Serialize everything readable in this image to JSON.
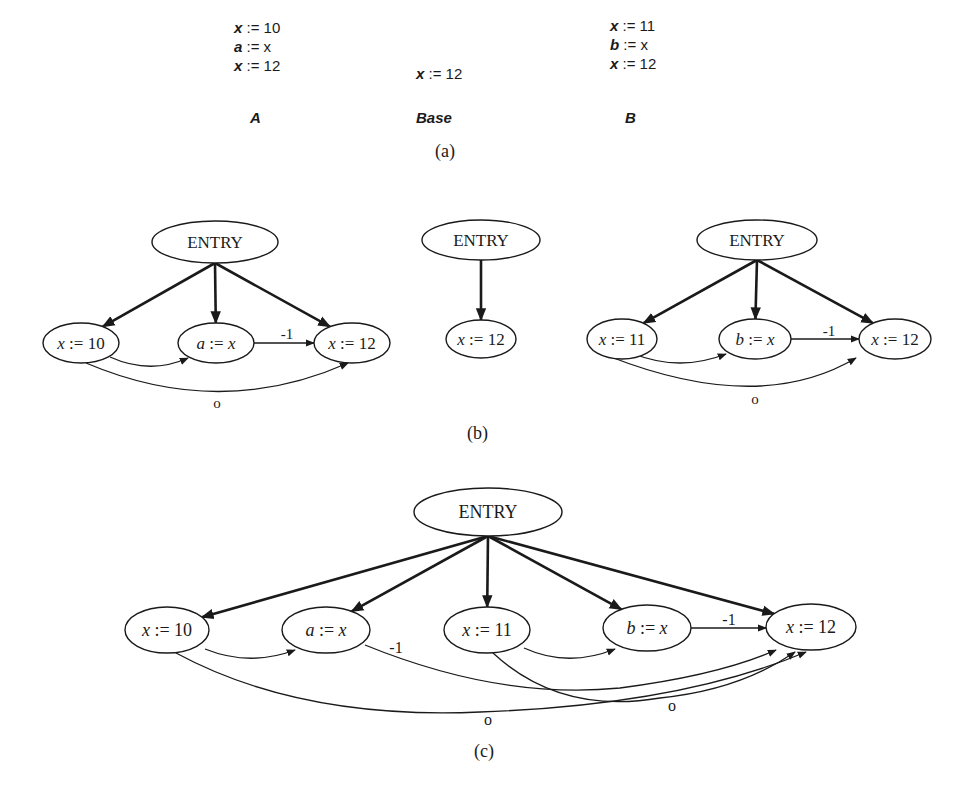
{
  "part_a": {
    "caption": "(a)",
    "programs": [
      {
        "name": "A",
        "lines": [
          {
            "var": "x",
            "rhs": ":= 10"
          },
          {
            "var": "a",
            "rhs": ":= x"
          },
          {
            "var": "x",
            "rhs": ":= 12"
          }
        ]
      },
      {
        "name": "Base",
        "lines": [
          {
            "var": "x",
            "rhs": ":= 12"
          }
        ]
      },
      {
        "name": "B",
        "lines": [
          {
            "var": "x",
            "rhs": ":= 11"
          },
          {
            "var": "b",
            "rhs": ":= x"
          },
          {
            "var": "x",
            "rhs": ":= 12"
          }
        ]
      }
    ]
  },
  "part_b": {
    "caption": "(b)",
    "graphs": [
      {
        "name": "A",
        "nodes": [
          {
            "id": "e",
            "label": "ENTRY",
            "cx": 215,
            "cy": 242,
            "rx": 63,
            "ry": 21
          },
          {
            "id": "n1",
            "label": "x := 10",
            "cx": 81,
            "cy": 343,
            "rx": 38,
            "ry": 20
          },
          {
            "id": "n2",
            "label": "a := x",
            "cx": 216,
            "cy": 343,
            "rx": 38,
            "ry": 20
          },
          {
            "id": "n3",
            "label": "x := 12",
            "cx": 352,
            "cy": 343,
            "rx": 38,
            "ry": 20
          }
        ],
        "control_edges": [
          [
            "e",
            "n1"
          ],
          [
            "e",
            "n2"
          ],
          [
            "e",
            "n3"
          ]
        ],
        "flow_edges": [
          {
            "from": "n1",
            "to": "n2",
            "path": "M110,357 Q150,375 188,358",
            "label": ""
          },
          {
            "from": "n2",
            "to": "n3",
            "path": "M254,343 L314,343",
            "label": "-1",
            "lx": 287,
            "ly": 339
          },
          {
            "from": "n1",
            "to": "n3",
            "path": "M86,363 Q220,420 348,363",
            "label": "o",
            "lx": 217,
            "ly": 408
          }
        ]
      },
      {
        "name": "Base",
        "nodes": [
          {
            "id": "e",
            "label": "ENTRY",
            "cx": 481,
            "cy": 240,
            "rx": 59,
            "ry": 20
          },
          {
            "id": "n1",
            "label": "x := 12",
            "cx": 481,
            "cy": 339,
            "rx": 35,
            "ry": 19
          }
        ],
        "control_edges": [
          [
            "e",
            "n1"
          ]
        ],
        "flow_edges": []
      },
      {
        "name": "B",
        "nodes": [
          {
            "id": "e",
            "label": "ENTRY",
            "cx": 757,
            "cy": 240,
            "rx": 60,
            "ry": 20
          },
          {
            "id": "n1",
            "label": "x := 11",
            "cx": 622,
            "cy": 339,
            "rx": 35,
            "ry": 20
          },
          {
            "id": "n2",
            "label": "b := x",
            "cx": 755,
            "cy": 339,
            "rx": 36,
            "ry": 20
          },
          {
            "id": "n3",
            "label": "x := 12",
            "cx": 895,
            "cy": 339,
            "rx": 36,
            "ry": 20
          }
        ],
        "control_edges": [
          [
            "e",
            "n1"
          ],
          [
            "e",
            "n2"
          ],
          [
            "e",
            "n3"
          ]
        ],
        "flow_edges": [
          {
            "from": "n1",
            "to": "n2",
            "path": "M634,354 Q680,372 726,354",
            "label": ""
          },
          {
            "from": "n2",
            "to": "n3",
            "path": "M791,339 L859,339",
            "label": "-1",
            "lx": 829,
            "ly": 336
          },
          {
            "from": "n1",
            "to": "n3",
            "path": "M611,357 Q760,415 856,358",
            "label": "o",
            "lx": 755,
            "ly": 404
          }
        ]
      }
    ]
  },
  "part_c": {
    "caption": "(c)",
    "nodes": [
      {
        "id": "e",
        "label": "ENTRY",
        "cx": 488,
        "cy": 512,
        "rx": 74,
        "ry": 24
      },
      {
        "id": "n1",
        "label": "x := 10",
        "cx": 167,
        "cy": 630,
        "rx": 42,
        "ry": 23
      },
      {
        "id": "n2",
        "label": "a := x",
        "cx": 326,
        "cy": 630,
        "rx": 44,
        "ry": 23
      },
      {
        "id": "n3",
        "label": "x := 11",
        "cx": 487,
        "cy": 630,
        "rx": 43,
        "ry": 23
      },
      {
        "id": "n4",
        "label": "b := x",
        "cx": 647,
        "cy": 628,
        "rx": 44,
        "ry": 23
      },
      {
        "id": "n5",
        "label": "x := 12",
        "cx": 811,
        "cy": 627,
        "rx": 45,
        "ry": 23
      }
    ],
    "control_edges": [
      [
        "e",
        "n1"
      ],
      [
        "e",
        "n2"
      ],
      [
        "e",
        "n3"
      ],
      [
        "e",
        "n4"
      ],
      [
        "e",
        "n5"
      ]
    ],
    "flow_edges": [
      {
        "from": "n1",
        "to": "n2",
        "path": "M205,649 Q250,667 295,650",
        "label": ""
      },
      {
        "from": "n2",
        "to": "n5",
        "path": "M365,645 Q500,700 620,688 Q720,675 776,650",
        "label": "-1",
        "lx": 396,
        "ly": 653
      },
      {
        "from": "n3",
        "to": "n4",
        "path": "M524,648 Q568,668 615,649",
        "label": ""
      },
      {
        "from": "n4",
        "to": "n5",
        "path": "M691,628 L766,628",
        "label": "-1",
        "lx": 729,
        "ly": 625
      },
      {
        "from": "n1",
        "to": "n5",
        "path": "M176,653 Q300,720 480,712 Q680,705 806,652",
        "label": "o",
        "lx": 488,
        "ly": 725
      },
      {
        "from": "n3",
        "to": "n5",
        "path": "M493,653 Q560,715 660,698 Q740,690 795,652",
        "label": "o",
        "lx": 672,
        "ly": 711
      }
    ]
  }
}
